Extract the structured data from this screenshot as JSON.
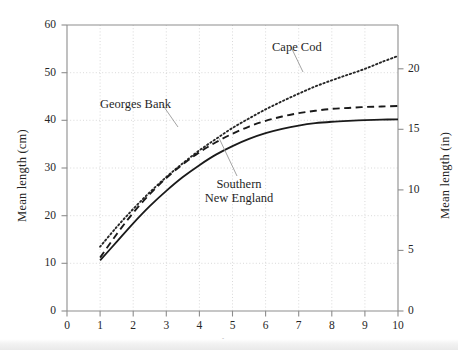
{
  "chart_data": {
    "type": "line",
    "title": "",
    "xlabel": "Age",
    "ylabel": "Mean length (cm)",
    "ylabel_secondary": "Mean length (in)",
    "xlim": [
      0,
      10
    ],
    "ylim": [
      0,
      60
    ],
    "ylim_secondary": [
      0,
      23.62
    ],
    "grid": true,
    "legend_position": "inline-annotations",
    "xticks": [
      "0",
      "1",
      "2",
      "3",
      "4",
      "5",
      "6",
      "7",
      "8",
      "9",
      "10"
    ],
    "xtick_values": [
      0,
      1,
      2,
      3,
      4,
      5,
      6,
      7,
      8,
      9,
      10
    ],
    "yticks": [
      "0",
      "10",
      "20",
      "30",
      "40",
      "50",
      "60"
    ],
    "ytick_values": [
      0,
      10,
      20,
      30,
      40,
      50,
      60
    ],
    "yticks_secondary": [
      "0",
      "5",
      "10",
      "15",
      "20"
    ],
    "ytick_secondary_values": [
      0,
      5,
      10,
      15,
      20
    ],
    "x": [
      1,
      1.5,
      2,
      2.5,
      3,
      3.5,
      4,
      4.5,
      5,
      5.5,
      6,
      6.5,
      7,
      7.5,
      8,
      8.5,
      9,
      9.5,
      10
    ],
    "series": [
      {
        "name": "Cape Cod",
        "style": "dotted",
        "color": "#262626",
        "values": [
          13.5,
          17.6,
          21.4,
          24.9,
          28.1,
          31.0,
          33.7,
          36.1,
          38.4,
          40.4,
          42.3,
          44.0,
          45.6,
          47.1,
          48.4,
          49.6,
          50.8,
          52.2,
          53.5
        ]
      },
      {
        "name": "Georges Bank",
        "style": "dashed",
        "color": "#1a1a1a",
        "values": [
          11.2,
          16.1,
          20.6,
          24.5,
          27.9,
          30.8,
          33.3,
          35.4,
          37.2,
          38.7,
          39.9,
          40.8,
          41.5,
          42.0,
          42.4,
          42.6,
          42.8,
          42.9,
          43.0
        ]
      },
      {
        "name": "Southern New England",
        "style": "solid",
        "color": "#1a1a1a",
        "values": [
          10.6,
          14.5,
          18.4,
          22.0,
          25.2,
          28.1,
          30.6,
          32.8,
          34.6,
          36.1,
          37.3,
          38.2,
          38.9,
          39.4,
          39.7,
          39.9,
          40.05,
          40.15,
          40.2
        ]
      }
    ],
    "annotations": [
      {
        "text": "Cape Cod",
        "x": 6.2,
        "y": 55.4
      },
      {
        "text": "Georges Bank",
        "x": 2.55,
        "y": 44.5
      },
      {
        "text": "Southern New England",
        "line1": "Southern",
        "line2": "New England",
        "x": 5.7,
        "y": 28.5
      }
    ]
  },
  "axes": {
    "left_title": "Mean length (cm)",
    "right_title": "Mean length (in)",
    "x_title": "Age"
  },
  "labels": {
    "cape_cod": "Cape Cod",
    "georges_bank": "Georges Bank",
    "southern_line1": "Southern",
    "southern_line2": "New England"
  },
  "colors": {
    "axis": "#8d8d8d",
    "grid": "#cfcfcf",
    "curve": "#1a1a1a",
    "text": "#1f1f1f"
  }
}
